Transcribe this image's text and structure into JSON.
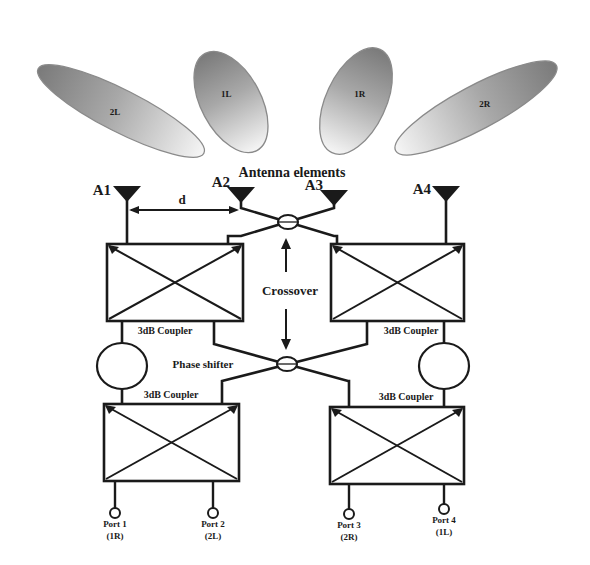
{
  "diagram": {
    "title": "Antenna elements",
    "beams": [
      {
        "label": "2L",
        "cx": 121,
        "cy": 111,
        "rx": 93,
        "ry": 21,
        "angle": 27
      },
      {
        "label": "1L",
        "cx": 231,
        "cy": 102,
        "rx": 55,
        "ry": 30,
        "angle": 62
      },
      {
        "label": "1R",
        "cx": 356,
        "cy": 101,
        "rx": 57,
        "ry": 30,
        "angle": -65
      },
      {
        "label": "2R",
        "cx": 476,
        "cy": 108,
        "rx": 91,
        "ry": 22,
        "angle": -28
      }
    ],
    "antennas": [
      {
        "label": "A1",
        "x": 127
      },
      {
        "label": "A2",
        "x": 241
      },
      {
        "label": "A3",
        "x": 334
      },
      {
        "label": "A4",
        "x": 446
      }
    ],
    "spacing_label": "d",
    "crossover_label": "Crossover",
    "phase_shifter_label": "Phase shifter",
    "couplers": [
      {
        "label": "3dB Coupler",
        "position": "upper-left"
      },
      {
        "label": "3dB Coupler",
        "position": "upper-right"
      },
      {
        "label": "3dB Coupler",
        "position": "lower-left"
      },
      {
        "label": "3dB Coupler",
        "position": "lower-right"
      }
    ],
    "ports": [
      {
        "label": "Port 1",
        "beam": "(1R)",
        "x": 115
      },
      {
        "label": "Port 2",
        "beam": "(2L)",
        "x": 213
      },
      {
        "label": "Port 3",
        "beam": "(2R)",
        "x": 349
      },
      {
        "label": "Port 4",
        "beam": "(1L)",
        "x": 444
      }
    ],
    "colors": {
      "line": "#1a1a1a",
      "beam_dark": "#7a7a7a",
      "beam_light": "#f4f4f4",
      "background": "#ffffff"
    }
  }
}
